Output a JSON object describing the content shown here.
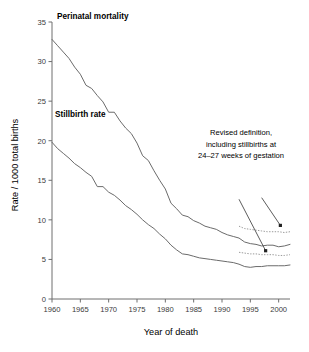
{
  "chart_data": {
    "type": "line",
    "title": "",
    "xlabel": "Year of death",
    "ylabel": "Rate / 1000 total births",
    "xlim": [
      1960,
      2002
    ],
    "ylim": [
      0,
      35
    ],
    "xticks": [
      1960,
      1965,
      1970,
      1975,
      1980,
      1985,
      1990,
      1995,
      2000
    ],
    "yticks": [
      0,
      5,
      10,
      15,
      20,
      25,
      30,
      35
    ],
    "grid": false,
    "legend": "inline-labels",
    "series": [
      {
        "name": "Perinatal mortality",
        "style": "solid",
        "x": [
          1960,
          1961,
          1962,
          1963,
          1964,
          1965,
          1966,
          1967,
          1968,
          1969,
          1970,
          1971,
          1972,
          1973,
          1974,
          1975,
          1976,
          1977,
          1978,
          1979,
          1980,
          1981,
          1982,
          1983,
          1984,
          1985,
          1986,
          1987,
          1988,
          1989,
          1990,
          1991,
          1992,
          1993,
          1994,
          1995,
          1996,
          1997,
          1998,
          1999,
          2000,
          2001,
          2002
        ],
        "values": [
          32.8,
          32.0,
          31.2,
          30.4,
          29.3,
          28.4,
          27.0,
          26.6,
          25.7,
          24.9,
          23.6,
          23.6,
          22.5,
          21.6,
          20.9,
          19.7,
          18.1,
          17.5,
          16.2,
          15.0,
          13.9,
          12.1,
          11.4,
          10.6,
          10.4,
          9.9,
          9.6,
          9.2,
          9.0,
          8.8,
          8.4,
          8.1,
          7.9,
          7.7,
          7.2,
          7.0,
          6.9,
          6.7,
          6.8,
          6.8,
          6.6,
          6.7,
          6.9
        ]
      },
      {
        "name": "Stillbirth rate",
        "style": "solid",
        "x": [
          1960,
          1961,
          1962,
          1963,
          1964,
          1965,
          1966,
          1967,
          1968,
          1969,
          1970,
          1971,
          1972,
          1973,
          1974,
          1975,
          1976,
          1977,
          1978,
          1979,
          1980,
          1981,
          1982,
          1983,
          1984,
          1985,
          1986,
          1987,
          1988,
          1989,
          1990,
          1991,
          1992,
          1993,
          1994,
          1995,
          1996,
          1997,
          1998,
          1999,
          2000,
          2001,
          2002
        ],
        "values": [
          19.8,
          19.0,
          18.4,
          17.8,
          17.1,
          16.6,
          16.0,
          15.5,
          14.2,
          14.2,
          13.5,
          13.1,
          12.5,
          11.8,
          11.3,
          10.7,
          10.0,
          9.4,
          8.9,
          8.2,
          7.6,
          6.8,
          6.2,
          5.7,
          5.6,
          5.4,
          5.2,
          5.1,
          5.0,
          4.9,
          4.8,
          4.7,
          4.6,
          4.4,
          4.1,
          4.0,
          4.1,
          4.1,
          4.2,
          4.2,
          4.2,
          4.2,
          4.3
        ]
      },
      {
        "name": "Perinatal mortality (revised definition)",
        "style": "dotted",
        "x": [
          1993,
          1994,
          1995,
          1996,
          1997,
          1998,
          1999,
          2000,
          2001,
          2002
        ],
        "values": [
          9.2,
          8.9,
          8.8,
          8.7,
          8.6,
          8.5,
          8.5,
          8.5,
          8.4,
          8.5
        ]
      },
      {
        "name": "Stillbirth rate (revised definition)",
        "style": "dotted",
        "x": [
          1993,
          1994,
          1995,
          1996,
          1997,
          1998,
          1999,
          2000,
          2001,
          2002
        ],
        "values": [
          5.9,
          5.8,
          5.7,
          5.7,
          5.6,
          5.6,
          5.6,
          5.5,
          5.5,
          5.6
        ]
      }
    ],
    "annotations": [
      {
        "text_lines": [
          "Revised definition,",
          "including stillbirths at",
          "24–27 weeks of gestation"
        ],
        "arrows": [
          {
            "from": [
              1993.0,
              12.6
            ],
            "to": [
              1997.7,
              6.1
            ]
          },
          {
            "from": [
              1997.0,
              12.8
            ],
            "to": [
              2000.3,
              9.3
            ]
          }
        ]
      }
    ]
  },
  "labels": {
    "series_perinatal": "Perinatal mortality",
    "series_stillbirth": "Stillbirth rate",
    "ylabel": "Rate / 1000 total births",
    "xlabel": "Year of death",
    "annot_line1": "Revised definition,",
    "annot_line2": "including stillbirths at",
    "annot_line3": "24–27 weeks of gestation"
  },
  "colors": {
    "line": "#6b6b6b",
    "dotted": "#9a9a9a",
    "axis": "#6e6e6e",
    "text": "#1a1a1a",
    "arrow": "#4a4a4a"
  }
}
